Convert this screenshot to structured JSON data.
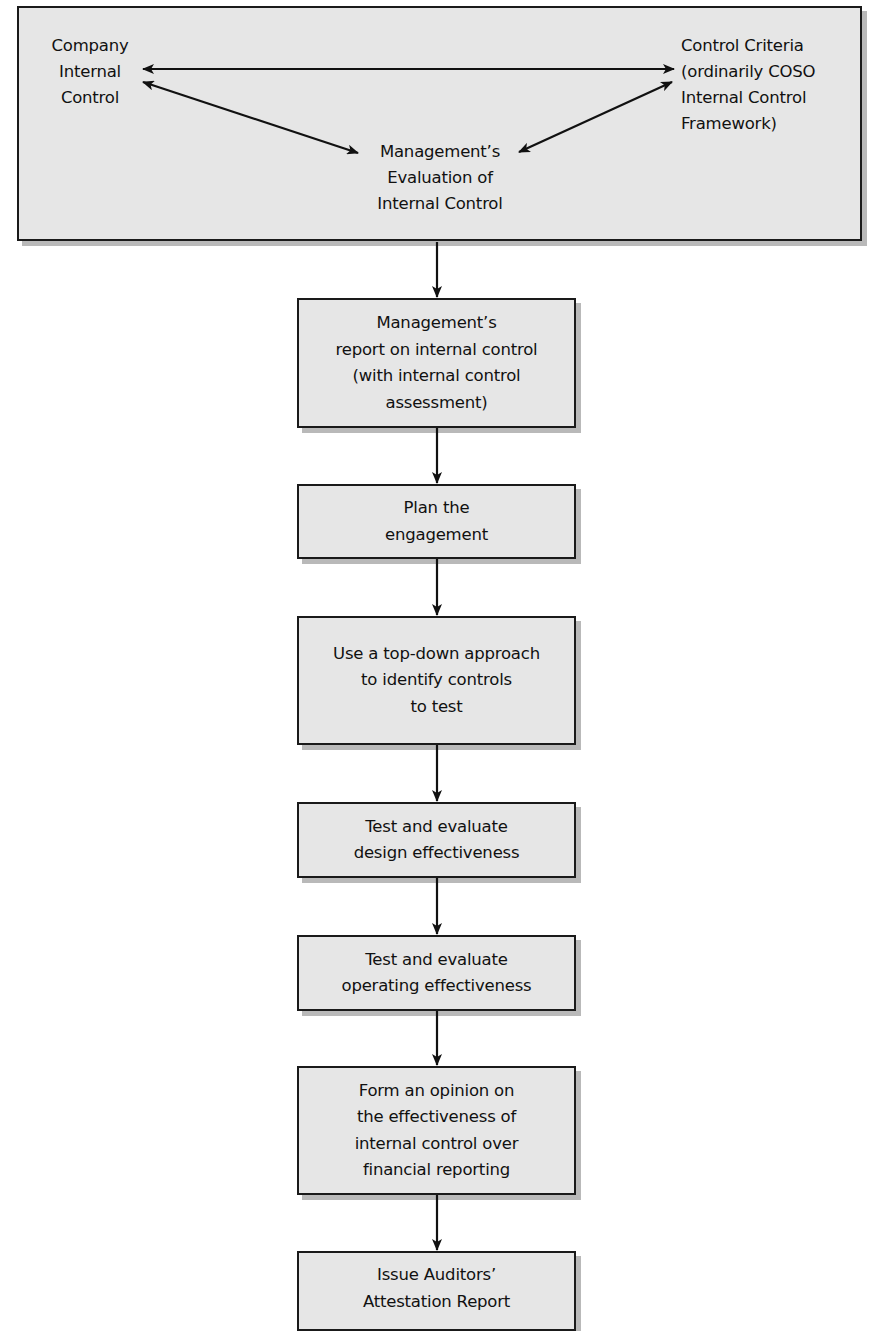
{
  "diagram": {
    "top_section": {
      "company_internal_control": "Company\nInternal\nControl",
      "control_criteria": "Control Criteria\n(ordinarily COSO\nInternal Control\nFramework)",
      "management_evaluation": "Management’s\nEvaluation of\nInternal Control",
      "relationships": [
        {
          "from": "Company Internal Control",
          "to": "Control Criteria",
          "type": "bidirectional-arrow"
        },
        {
          "from": "Company Internal Control",
          "to": "Management’s Evaluation of Internal Control",
          "type": "bidirectional-arrow"
        },
        {
          "from": "Control Criteria",
          "to": "Management’s Evaluation of Internal Control",
          "type": "bidirectional-arrow"
        }
      ]
    },
    "steps": [
      {
        "label": "Management’s\nreport on internal control\n(with internal control\nassessment)"
      },
      {
        "label": "Plan the\nengagement"
      },
      {
        "label": "Use a top-down approach\nto identify controls\nto test"
      },
      {
        "label": "Test and evaluate\ndesign effectiveness"
      },
      {
        "label": "Test and evaluate\noperating effectiveness"
      },
      {
        "label": "Form an opinion on\nthe effectiveness of\ninternal control over\nfinancial reporting"
      },
      {
        "label": "Issue Auditors’\nAttestation Report"
      }
    ],
    "colors": {
      "box_fill": "#e6e6e6",
      "box_border": "#1a1a1a",
      "box_shadow": "#b9b9b9",
      "arrow": "#111111"
    }
  }
}
